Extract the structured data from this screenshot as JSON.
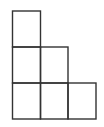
{
  "diagram": {
    "type": "staircase-young-diagram",
    "column_heights": [
      3,
      2,
      1
    ],
    "cells": [
      {
        "col": 0,
        "row": 0
      },
      {
        "col": 0,
        "row": 1
      },
      {
        "col": 0,
        "row": 2
      },
      {
        "col": 1,
        "row": 1
      },
      {
        "col": 1,
        "row": 2
      },
      {
        "col": 2,
        "row": 2
      }
    ],
    "grid": {
      "x": [
        12.5,
        40.5,
        68,
        96
      ],
      "y": [
        11,
        47,
        83,
        119
      ]
    },
    "stroke_color": "#333333",
    "background_color": "#ffffff"
  }
}
